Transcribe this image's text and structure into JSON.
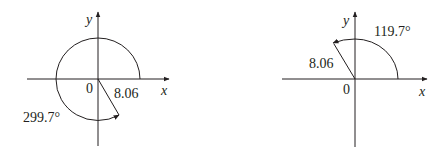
{
  "diagrams": [
    {
      "id": "left",
      "origin_label": "0",
      "x_axis_label": "x",
      "y_axis_label": "y",
      "magnitude_label": "8.06",
      "angle_label": "299.7°",
      "angle_deg": 299.7,
      "magnitude": 8.06
    },
    {
      "id": "right",
      "origin_label": "0",
      "x_axis_label": "x",
      "y_axis_label": "y",
      "magnitude_label": "8.06",
      "angle_label": "119.7°",
      "angle_deg": 119.7,
      "magnitude": 8.06
    }
  ],
  "colors": {
    "ink": "#231f20",
    "background": "#ffffff"
  }
}
